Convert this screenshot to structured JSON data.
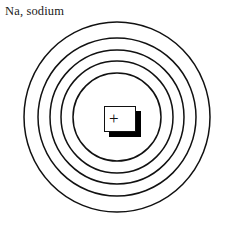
{
  "figure": {
    "label": "Na, sodium",
    "element_symbol": "Na",
    "element_name": "sodium",
    "nucleus_charge_symbol": "+",
    "stroke_color": "#111111",
    "background_color": "#ffffff",
    "nucleus_fill_color": "#ffffff",
    "nucleus_shadow_color": "#000000"
  },
  "chart_data": {
    "type": "diagram",
    "title": "Na, sodium",
    "subtype": "bohr-atomic-shell-diagram",
    "center": {
      "cx": 117,
      "cy": 117
    },
    "shell_count": 5,
    "shells": [
      {
        "index": 1,
        "rx": 44,
        "ry": 44
      },
      {
        "index": 2,
        "rx": 56,
        "ry": 56
      },
      {
        "index": 3,
        "rx": 67,
        "ry": 67
      },
      {
        "index": 4,
        "rx": 79,
        "ry": 79
      },
      {
        "index": 5,
        "rx": 93,
        "ry": 95
      }
    ],
    "nucleus": {
      "shape": "rectangle",
      "charge": "+",
      "x": 104,
      "y": 106,
      "width": 30,
      "height": 24,
      "shadow_offset": 5
    }
  }
}
